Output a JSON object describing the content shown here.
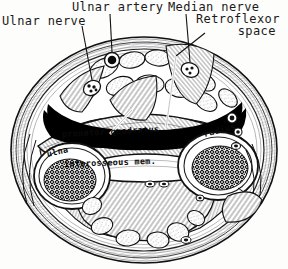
{
  "figure": {
    "background_color": "#fdfdfc",
    "ink_color": "#1a1a1a",
    "void_color": "#000000"
  },
  "external_labels": [
    {
      "id": "ulnar-artery",
      "text": "Ulnar artery",
      "x": 72,
      "y": 1
    },
    {
      "id": "ulnar-nerve",
      "text": "Ulnar nerve",
      "x": 2,
      "y": 15
    },
    {
      "id": "median-nerve",
      "text": "Median nerve",
      "x": 168,
      "y": 1
    },
    {
      "id": "retroflexor-1",
      "text": "Retroflexor",
      "x": 196,
      "y": 13
    },
    {
      "id": "retroflexor-2",
      "text": "space",
      "x": 218,
      "y": 25
    }
  ],
  "internal_labels": [
    {
      "id": "pronator-quadratus",
      "text": "pronator quadratus",
      "x": 62,
      "y": 130,
      "rotate": -3
    },
    {
      "id": "radius",
      "text": "radius",
      "x": 204,
      "y": 130,
      "rotate": -14
    },
    {
      "id": "ulna",
      "text": "ulna",
      "x": 47,
      "y": 150,
      "rotate": -13
    },
    {
      "id": "interosseous-mem",
      "text": "interosseous mem.",
      "x": 64,
      "y": 160,
      "rotate": -2
    }
  ],
  "anatomy": {
    "section_outline": "oval transverse section of forearm",
    "bones": [
      "ulna",
      "radius"
    ],
    "muscle": "pronator quadratus",
    "membrane": "interosseous membrane",
    "space": "retroflexor space",
    "vessels": [
      "ulnar artery"
    ],
    "nerves": [
      "ulnar nerve",
      "median nerve"
    ]
  }
}
